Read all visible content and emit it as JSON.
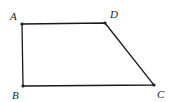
{
  "figure": {
    "type": "quadrilateral",
    "stroke_color": "#1a1a1a",
    "vertices": [
      {
        "label": "A",
        "x": 22,
        "y": 24,
        "label_x": 10,
        "label_y": 20
      },
      {
        "label": "D",
        "x": 105,
        "y": 23,
        "label_x": 110,
        "label_y": 18
      },
      {
        "label": "C",
        "x": 154,
        "y": 85,
        "label_x": 157,
        "label_y": 98
      },
      {
        "label": "B",
        "x": 23,
        "y": 86,
        "label_x": 12,
        "label_y": 99
      }
    ],
    "edges": [
      [
        "A",
        "D"
      ],
      [
        "D",
        "C"
      ],
      [
        "C",
        "B"
      ],
      [
        "B",
        "A"
      ]
    ]
  }
}
